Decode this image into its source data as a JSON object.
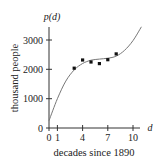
{
  "chart_data": {
    "type": "scatter",
    "title": "",
    "xlabel": "decades since 1890",
    "ylabel": "thousand people",
    "x_axis_var": "d",
    "y_axis_var": "p(d)",
    "xlim": [
      0,
      11
    ],
    "ylim": [
      0,
      3500
    ],
    "x_ticks": [
      0,
      1,
      4,
      7,
      10
    ],
    "y_ticks": [
      0,
      1000,
      2000,
      3000
    ],
    "grid": false,
    "legend": null,
    "series": [
      {
        "name": "data points",
        "kind": "scatter",
        "x": [
          3,
          4,
          5,
          6,
          7,
          8
        ],
        "y": [
          2040,
          2320,
          2250,
          2195,
          2330,
          2525
        ]
      },
      {
        "name": "model p(d)",
        "kind": "line",
        "x": [
          0,
          1,
          2,
          3,
          4,
          5,
          6,
          7,
          8,
          9,
          10,
          11
        ],
        "y": [
          250,
          1000,
          1600,
          1980,
          2200,
          2310,
          2350,
          2380,
          2450,
          2650,
          2980,
          3450
        ]
      }
    ]
  },
  "labels": {
    "y_axis_var": "p(d)",
    "x_axis_var": "d",
    "xlabel": "decades since 1890",
    "ylabel": "thousand people",
    "x_tick_labels": [
      "0",
      "1",
      "4",
      "7",
      "10"
    ],
    "y_tick_labels": [
      "0",
      "1000",
      "2000",
      "3000"
    ]
  }
}
